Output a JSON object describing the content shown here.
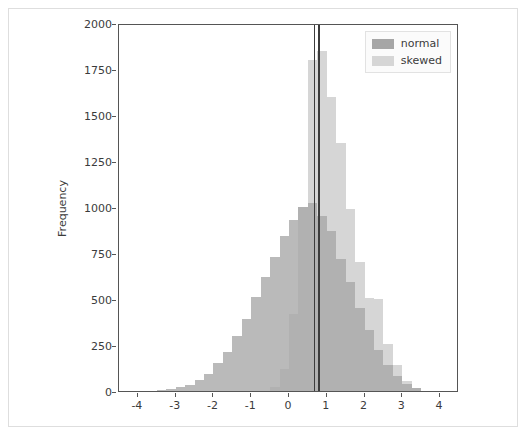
{
  "figure": {
    "background": "#ffffff",
    "axes_color": "#555555",
    "text_color": "#3b3b3b",
    "border_color": "#dedede"
  },
  "legend": {
    "position": "upper-right",
    "entries": [
      {
        "label": "normal",
        "color": "#a6a6a6",
        "swatch_name": "legend-swatch-normal"
      },
      {
        "label": "skewed",
        "color": "#d6d6d6",
        "swatch_name": "legend-swatch-skewed"
      }
    ]
  },
  "chart_data": {
    "type": "bar",
    "chart_subtype": "overlapping-histogram",
    "title": "",
    "xlabel": "",
    "ylabel": "Frequency",
    "xlim": [
      -4.5,
      4.5
    ],
    "ylim": [
      0,
      2000
    ],
    "grid": false,
    "legend_position": "upper right",
    "alpha": 0.6,
    "bin_width": 0.25,
    "xticks": [
      -4,
      -3,
      -2,
      -1,
      0,
      1,
      2,
      3,
      4
    ],
    "xtick_labels": [
      "-4",
      "-3",
      "-2",
      "-1",
      "0",
      "1",
      "2",
      "3",
      "4"
    ],
    "yticks": [
      0,
      250,
      500,
      750,
      1000,
      1250,
      1500,
      1750,
      2000
    ],
    "ytick_labels": [
      "0",
      "250",
      "500",
      "750",
      "1000",
      "1250",
      "1500",
      "1750",
      "2000"
    ],
    "bin_centers": [
      -3.375,
      -3.125,
      -2.875,
      -2.625,
      -2.375,
      -2.125,
      -1.875,
      -1.625,
      -1.375,
      -1.125,
      -0.875,
      -0.625,
      -0.375,
      -0.125,
      0.125,
      0.375,
      0.625,
      0.875,
      1.125,
      1.375,
      1.625,
      1.875,
      2.125,
      2.375,
      2.625,
      2.875,
      3.125,
      3.375
    ],
    "series": [
      {
        "name": "normal",
        "color": "#a6a6a6",
        "values": [
          5,
          10,
          20,
          35,
          60,
          95,
          150,
          210,
          300,
          390,
          510,
          620,
          730,
          840,
          930,
          1000,
          1020,
          950,
          870,
          720,
          590,
          450,
          330,
          225,
          140,
          80,
          40,
          15
        ]
      },
      {
        "name": "skewed",
        "color": "#d6d6d6",
        "values": [
          0,
          0,
          0,
          0,
          0,
          0,
          0,
          0,
          0,
          0,
          0,
          0,
          20,
          120,
          420,
          1000,
          1800,
          1850,
          1600,
          1350,
          990,
          700,
          505,
          500,
          255,
          140,
          55,
          15
        ]
      }
    ],
    "vlines": [
      {
        "name": "mean-line-normal",
        "x": 0.68,
        "color": "#3c3c3c",
        "linewidth": 1.5
      },
      {
        "name": "mean-line-skewed",
        "x": 0.8,
        "color": "#3c3c3c",
        "linewidth": 1.5
      }
    ]
  }
}
